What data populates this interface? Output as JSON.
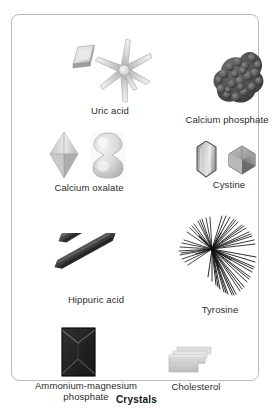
{
  "figure": {
    "caption": "Crystals",
    "panel_border_color": "#b9b9b9",
    "background_color": "#ffffff",
    "label_color": "#2b2b2b"
  },
  "specimens": [
    {
      "id": "uric-acid",
      "label": "Uric acid",
      "icon": "uric-acid-crystal-icon",
      "shape": "rhombic plate and six-rayed rosette",
      "tone": "#d8d8d8"
    },
    {
      "id": "calcium-phosphate",
      "label": "Calcium phosphate",
      "icon": "calcium-phosphate-crystal-icon",
      "shape": "dark granular amorphous cluster",
      "tone": "#4a4a4a"
    },
    {
      "id": "calcium-oxalate",
      "label": "Calcium oxalate",
      "icon": "calcium-oxalate-crystal-icon",
      "shape": "octahedral envelope and dumbbell",
      "tone": "#c9c9c9"
    },
    {
      "id": "cystine",
      "label": "Cystine",
      "icon": "cystine-crystal-icon",
      "shape": "elongated hexagonal plate and faceted hexagon",
      "tone": "#9a9a9a"
    },
    {
      "id": "hippuric-acid",
      "label": "Hippuric acid",
      "icon": "hippuric-acid-crystal-icon",
      "shape": "two dark elongated prisms",
      "tone": "#3e3e3e"
    },
    {
      "id": "tyrosine",
      "label": "Tyrosine",
      "icon": "tyrosine-crystal-icon",
      "shape": "radiating sheaf of fine needles",
      "tone": "#1f1f1f"
    },
    {
      "id": "ammonium-magnesium-phosphate",
      "label": "Ammonium-magnesium\nphosphate",
      "icon": "ammonium-magnesium-phosphate-crystal-icon",
      "shape": "dark coffin-lid rectangular prism",
      "tone": "#262626"
    },
    {
      "id": "cholesterol",
      "label": "Cholesterol",
      "icon": "cholesterol-crystal-icon",
      "shape": "stacked flat plate with notched corner",
      "tone": "#cfcfcf"
    }
  ]
}
